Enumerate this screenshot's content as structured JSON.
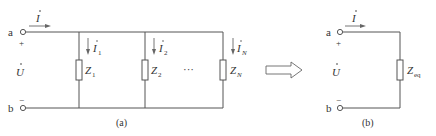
{
  "figure": {
    "left_circuit": {
      "caption": "(a)",
      "terminal_a": "a",
      "terminal_b": "b",
      "plus": "+",
      "minus": "−",
      "voltage_label": "U",
      "current_label": "I",
      "ellipsis": "···",
      "branches": [
        {
          "current": "I",
          "current_sub": "1",
          "impedance": "Z",
          "impedance_sub": "1"
        },
        {
          "current": "I",
          "current_sub": "2",
          "impedance": "Z",
          "impedance_sub": "2"
        },
        {
          "current": "I",
          "current_sub": "N",
          "impedance": "Z",
          "impedance_sub": "N"
        }
      ]
    },
    "equivalence_arrow": "hollow-right-arrow",
    "right_circuit": {
      "caption": "(b)",
      "terminal_a": "a",
      "terminal_b": "b",
      "plus": "+",
      "minus": "−",
      "voltage_label": "U",
      "current_label": "I",
      "impedance": "Z",
      "impedance_sub": "eq"
    },
    "colors": {
      "wire": "#555555",
      "text": "#333333",
      "background": "#ffffff"
    }
  }
}
